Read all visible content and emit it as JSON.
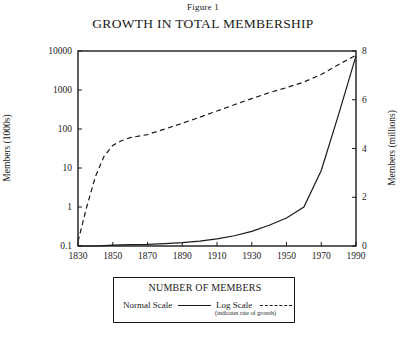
{
  "figure": {
    "caption": "Figure 1",
    "title": "GROWTH IN TOTAL MEMBERSHIP"
  },
  "legend": {
    "title": "NUMBER OF MEMBERS",
    "normal_label": "Normal Scale",
    "log_label": "Log Scale",
    "log_sublabel": "(indicates rate of growth)"
  },
  "chart_data": {
    "type": "line",
    "title": "GROWTH IN TOTAL MEMBERSHIP",
    "subtitle": "Figure 1",
    "xlabel": "",
    "xlim": [
      1830,
      1990
    ],
    "xticks": [
      1830,
      1850,
      1870,
      1890,
      1910,
      1930,
      1950,
      1970,
      1990
    ],
    "grid": false,
    "legend_position": "below-plot",
    "axes": [
      {
        "id": "left",
        "label": "Members (1000s)",
        "scale": "log",
        "lim": [
          0.1,
          10000
        ],
        "ticks": [
          0.1,
          1,
          10,
          100,
          1000,
          10000
        ],
        "ticklabels": [
          "0.1",
          "1",
          "10",
          "100",
          "1000",
          "10000"
        ]
      },
      {
        "id": "right",
        "label": "Members (millions)",
        "scale": "linear",
        "lim": [
          0,
          8
        ],
        "ticks": [
          0,
          2,
          4,
          6,
          8
        ],
        "ticklabels": [
          "0",
          "2",
          "4",
          "6",
          "8"
        ]
      }
    ],
    "series": [
      {
        "name": "Log Scale",
        "style": "dashed",
        "axis": "left",
        "units": "members (1000s)",
        "annotation": "indicates rate of growth",
        "x": [
          1830,
          1835,
          1840,
          1845,
          1850,
          1855,
          1860,
          1870,
          1880,
          1890,
          1900,
          1910,
          1920,
          1930,
          1940,
          1950,
          1960,
          1970,
          1980,
          1990
        ],
        "y": [
          0.13,
          1.0,
          6.0,
          20.0,
          38.0,
          50.0,
          60.0,
          72.0,
          100.0,
          140.0,
          200.0,
          290.0,
          420.0,
          600.0,
          850.0,
          1150.0,
          1600.0,
          2500.0,
          4500.0,
          7800.0
        ]
      },
      {
        "name": "Normal Scale",
        "style": "solid",
        "axis": "right",
        "units": "members (millions)",
        "x": [
          1830,
          1840,
          1850,
          1860,
          1870,
          1880,
          1890,
          1900,
          1910,
          1920,
          1930,
          1940,
          1950,
          1960,
          1970,
          1980,
          1990
        ],
        "y": [
          0.0,
          0.0,
          0.04,
          0.06,
          0.07,
          0.1,
          0.14,
          0.2,
          0.29,
          0.42,
          0.6,
          0.85,
          1.15,
          1.6,
          3.1,
          5.4,
          7.8
        ]
      }
    ]
  }
}
